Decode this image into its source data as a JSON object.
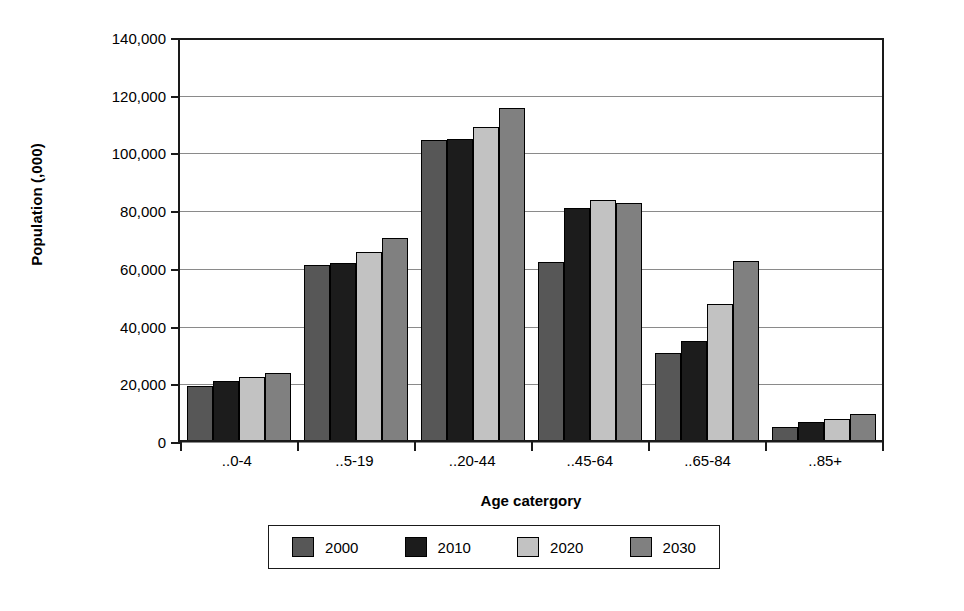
{
  "chart_data": {
    "type": "bar",
    "title": "",
    "xlabel": "Age catergory",
    "ylabel": "Population (,000)",
    "categories": [
      "..0-4",
      "..5-19",
      "..20-44",
      "..45-64",
      "..65-84",
      "..85+"
    ],
    "series": [
      {
        "name": "2000",
        "color": "#575757",
        "values": [
          19500,
          61300,
          104500,
          62500,
          31000,
          5200
        ]
      },
      {
        "name": "2010",
        "color": "#1c1c1c",
        "values": [
          21300,
          62000,
          105000,
          81000,
          35000,
          6800
        ]
      },
      {
        "name": "2020",
        "color": "#c2c2c2",
        "values": [
          22700,
          66000,
          109000,
          84000,
          47800,
          8000
        ]
      },
      {
        "name": "2030",
        "color": "#808080",
        "values": [
          24000,
          70800,
          115800,
          83000,
          62700,
          9800
        ]
      }
    ],
    "ylim": [
      0,
      140000
    ],
    "ytick_values": [
      0,
      20000,
      40000,
      60000,
      80000,
      100000,
      120000,
      140000
    ],
    "ytick_labels": [
      "0",
      "20,000",
      "40,000",
      "60,000",
      "80,000",
      "100,000",
      "120,000",
      "140,000"
    ],
    "grid": true,
    "legend_position": "bottom",
    "legend_entries": [
      "2000",
      "2010",
      "2020",
      "2030"
    ]
  }
}
